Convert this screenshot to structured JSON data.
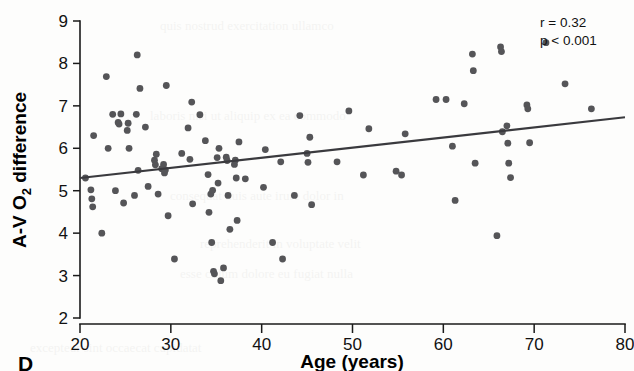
{
  "figure": {
    "panel_letter": "D",
    "background_color": "#fdfdfc",
    "point_color": "#555558",
    "line_color": "#3a3a3e",
    "axis_color": "#1a1a1a"
  },
  "chart_data": {
    "type": "scatter",
    "title": "",
    "xlabel": "Age (years)",
    "ylabel": "A-V O2 difference",
    "ylabel_main": "A-V O",
    "ylabel_sub": "2",
    "ylabel_tail": " difference",
    "xlim": [
      20,
      80
    ],
    "ylim": [
      2,
      9
    ],
    "xticks": [
      20,
      30,
      40,
      50,
      60,
      70,
      80
    ],
    "yticks": [
      2,
      3,
      4,
      5,
      6,
      7,
      8,
      9
    ],
    "grid": false,
    "legend": "none",
    "annotations": [
      "r = 0.32",
      "p < 0.001"
    ],
    "stats": {
      "r": "r = 0.32",
      "p": "p < 0.001"
    },
    "trend_line": {
      "x_start": 20,
      "y_start": 5.3,
      "x_end": 80,
      "y_end": 6.73
    },
    "points": [
      [
        20.6,
        5.3
      ],
      [
        21.2,
        5.02
      ],
      [
        21.3,
        4.81
      ],
      [
        21.4,
        4.62
      ],
      [
        21.5,
        6.3
      ],
      [
        22.4,
        4.0
      ],
      [
        22.9,
        7.69
      ],
      [
        23.1,
        6.0
      ],
      [
        23.6,
        6.8
      ],
      [
        23.9,
        5.0
      ],
      [
        24.2,
        6.61
      ],
      [
        24.3,
        6.57
      ],
      [
        24.5,
        6.81
      ],
      [
        24.8,
        4.71
      ],
      [
        25.2,
        6.42
      ],
      [
        25.3,
        6.59
      ],
      [
        25.4,
        6.0
      ],
      [
        26.0,
        4.89
      ],
      [
        26.2,
        6.8
      ],
      [
        26.3,
        8.2
      ],
      [
        26.4,
        5.48
      ],
      [
        26.6,
        7.41
      ],
      [
        27.2,
        6.5
      ],
      [
        27.5,
        5.1
      ],
      [
        28.2,
        5.72
      ],
      [
        28.3,
        5.61
      ],
      [
        28.4,
        5.86
      ],
      [
        28.6,
        4.92
      ],
      [
        29.0,
        5.52
      ],
      [
        29.2,
        5.62
      ],
      [
        29.3,
        5.42
      ],
      [
        29.4,
        5.49
      ],
      [
        29.5,
        7.48
      ],
      [
        29.7,
        4.41
      ],
      [
        30.4,
        3.39
      ],
      [
        31.2,
        5.88
      ],
      [
        31.9,
        6.48
      ],
      [
        32.1,
        5.74
      ],
      [
        32.3,
        7.09
      ],
      [
        32.4,
        4.69
      ],
      [
        33.2,
        6.79
      ],
      [
        33.8,
        6.18
      ],
      [
        34.1,
        5.38
      ],
      [
        34.2,
        4.49
      ],
      [
        34.4,
        4.92
      ],
      [
        34.5,
        3.78
      ],
      [
        34.6,
        5.01
      ],
      [
        34.7,
        3.1
      ],
      [
        34.8,
        3.04
      ],
      [
        35.1,
        5.78
      ],
      [
        35.2,
        5.18
      ],
      [
        35.3,
        6.0
      ],
      [
        35.5,
        2.88
      ],
      [
        35.8,
        3.18
      ],
      [
        36.1,
        5.79
      ],
      [
        36.2,
        5.71
      ],
      [
        36.3,
        4.89
      ],
      [
        36.5,
        4.09
      ],
      [
        37.0,
        5.62
      ],
      [
        37.1,
        5.72
      ],
      [
        37.2,
        5.3
      ],
      [
        37.3,
        4.3
      ],
      [
        37.5,
        6.15
      ],
      [
        38.2,
        5.28
      ],
      [
        40.2,
        5.08
      ],
      [
        40.4,
        5.97
      ],
      [
        41.2,
        3.78
      ],
      [
        42.1,
        5.68
      ],
      [
        42.3,
        3.39
      ],
      [
        43.6,
        4.89
      ],
      [
        44.2,
        6.77
      ],
      [
        45.0,
        5.88
      ],
      [
        45.1,
        5.67
      ],
      [
        45.3,
        6.26
      ],
      [
        45.5,
        4.67
      ],
      [
        48.3,
        5.68
      ],
      [
        49.6,
        6.88
      ],
      [
        51.2,
        5.37
      ],
      [
        51.8,
        6.46
      ],
      [
        54.8,
        5.46
      ],
      [
        55.4,
        5.37
      ],
      [
        55.8,
        6.34
      ],
      [
        59.2,
        7.15
      ],
      [
        60.3,
        7.15
      ],
      [
        61.0,
        6.05
      ],
      [
        61.3,
        4.77
      ],
      [
        62.3,
        7.05
      ],
      [
        63.2,
        8.22
      ],
      [
        63.3,
        7.83
      ],
      [
        63.5,
        5.65
      ],
      [
        65.9,
        3.94
      ],
      [
        66.3,
        8.39
      ],
      [
        66.4,
        8.28
      ],
      [
        66.5,
        6.39
      ],
      [
        67.0,
        6.53
      ],
      [
        67.1,
        6.12
      ],
      [
        67.2,
        5.65
      ],
      [
        67.4,
        5.31
      ],
      [
        69.2,
        7.02
      ],
      [
        69.3,
        6.93
      ],
      [
        69.5,
        6.13
      ],
      [
        71.3,
        8.49
      ],
      [
        73.4,
        7.52
      ],
      [
        76.3,
        6.93
      ]
    ]
  }
}
